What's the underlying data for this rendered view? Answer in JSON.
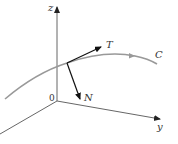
{
  "diagram": {
    "type": "3d-vector-diagram",
    "axes": {
      "z_label": "z",
      "y_label": "y",
      "origin_label": "0"
    },
    "curve": {
      "label": "C",
      "color": "#999999"
    },
    "vectors": [
      {
        "label": "T",
        "meaning": "unit tangent vector",
        "color": "#111111"
      },
      {
        "label": "N",
        "meaning": "principal normal vector",
        "color": "#111111"
      }
    ],
    "axis_color": "#555555"
  }
}
